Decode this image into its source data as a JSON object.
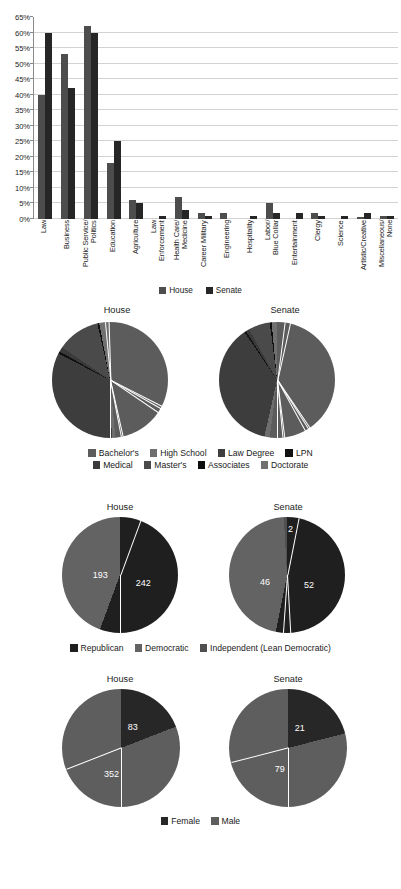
{
  "chart_data": [
    {
      "type": "bar",
      "title": "",
      "xlabel": "",
      "ylabel": "",
      "ylim": [
        0,
        65
      ],
      "grid": true,
      "legend_position": "bottom",
      "ticks": [
        "0%",
        "5%",
        "10%",
        "15%",
        "20%",
        "25%",
        "30%",
        "35%",
        "40%",
        "45%",
        "50%",
        "55%",
        "60%",
        "65%"
      ],
      "categories": [
        "Law",
        "Business",
        "Public Service/\nPolitics",
        "Education",
        "Agriculture",
        "Law\nEnforcement",
        "Health Care/\nMedicine",
        "Career Military",
        "Engineering",
        "Hospitality",
        "Labor/\nBlue Collar",
        "Entertainment",
        "Clergy",
        "Science",
        "Artistic/Creative",
        "Miscellaneous/\nNone"
      ],
      "series": [
        {
          "name": "House",
          "color": "#4d4d4d",
          "values": [
            40,
            53,
            62,
            18,
            6,
            0,
            7,
            2,
            2,
            0,
            5,
            0,
            2,
            0,
            0.5,
            1
          ]
        },
        {
          "name": "Senate",
          "color": "#262626",
          "values": [
            60,
            42,
            60,
            25,
            5,
            1,
            3,
            1,
            0,
            1,
            2,
            2,
            1,
            1,
            2,
            1
          ]
        }
      ]
    },
    {
      "type": "pie",
      "title": "Education",
      "charts": [
        {
          "title": "House",
          "labels": [
            "Bachelor's",
            "High School",
            "Law Degree",
            "LPN",
            "Medical",
            "Master's",
            "Associates",
            "Doctorate"
          ],
          "values": [
            48.5,
            1.0,
            33.0,
            0.7,
            1.3,
            12.0,
            0.5,
            3.0
          ]
        },
        {
          "title": "Senate",
          "labels": [
            "Bachelor's",
            "High School",
            "Law Degree",
            "LPN",
            "Medical",
            "Master's",
            "Associates",
            "Doctorate"
          ],
          "values": [
            52.0,
            1.5,
            37.0,
            0.5,
            1.0,
            6.0,
            0.5,
            1.5
          ]
        }
      ],
      "legend": [
        "Bachelor's",
        "High School",
        "Law Degree",
        "LPN",
        "Medical",
        "Master's",
        "Associates",
        "Doctorate"
      ],
      "legend_position": "bottom"
    },
    {
      "type": "pie",
      "title": "Party",
      "charts": [
        {
          "title": "House",
          "labels": [
            "Republican",
            "Democratic",
            "Independent (Lean Democratic)"
          ],
          "values": [
            242,
            193,
            0
          ],
          "data_labels": [
            "242",
            "193",
            ""
          ]
        },
        {
          "title": "Senate",
          "labels": [
            "Republican",
            "Democratic",
            "Independent (Lean Democratic)"
          ],
          "values": [
            52,
            46,
            2
          ],
          "data_labels": [
            "52",
            "46",
            "2"
          ]
        }
      ],
      "legend": [
        "Republican",
        "Democratic",
        "Independent (Lean Democratic)"
      ],
      "legend_position": "bottom"
    },
    {
      "type": "pie",
      "title": "Gender",
      "charts": [
        {
          "title": "House",
          "labels": [
            "Female",
            "Male"
          ],
          "values": [
            83,
            352
          ],
          "data_labels": [
            "83",
            "352"
          ]
        },
        {
          "title": "Senate",
          "labels": [
            "Female",
            "Male"
          ],
          "values": [
            21,
            79
          ],
          "data_labels": [
            "21",
            "79"
          ]
        }
      ],
      "legend": [
        "Female",
        "Male"
      ],
      "legend_position": "bottom"
    }
  ],
  "bar_chart": {
    "y_ticks": [
      "65%",
      "60%",
      "55%",
      "50%",
      "45%",
      "40%",
      "35%",
      "30%",
      "25%",
      "20%",
      "15%",
      "10%",
      "5%",
      "0%"
    ],
    "categories": [
      {
        "label": "Law"
      },
      {
        "label": "Business"
      },
      {
        "label": "Public Service/\nPolitics"
      },
      {
        "label": "Education"
      },
      {
        "label": "Agriculture"
      },
      {
        "label": "Law\nEnforcement"
      },
      {
        "label": "Health Care/\nMedicine"
      },
      {
        "label": "Career Military"
      },
      {
        "label": "Engineering"
      },
      {
        "label": "Hospitality"
      },
      {
        "label": "Labor/\nBlue Collar"
      },
      {
        "label": "Entertainment"
      },
      {
        "label": "Clergy"
      },
      {
        "label": "Science"
      },
      {
        "label": "Artistic/Creative"
      },
      {
        "label": "Miscellaneous/\nNone"
      }
    ],
    "legend": [
      {
        "label": "House",
        "color": "#4d4d4d"
      },
      {
        "label": "Senate",
        "color": "#262626"
      }
    ]
  },
  "education_section": {
    "house_title": "House",
    "senate_title": "Senate",
    "legend_row1": [
      {
        "label": "Bachelor's",
        "color": "#5c5c5c"
      },
      {
        "label": "High School",
        "color": "#6e6e6e"
      },
      {
        "label": "Law Degree",
        "color": "#3d3d3d"
      },
      {
        "label": "LPN",
        "color": "#111111"
      }
    ],
    "legend_row2": [
      {
        "label": "Medical",
        "color": "#3a3a3a"
      },
      {
        "label": "Master's",
        "color": "#4a4a4a"
      },
      {
        "label": "Associates",
        "color": "#0d0d0d"
      },
      {
        "label": "Doctorate",
        "color": "#707070"
      }
    ]
  },
  "party_section": {
    "house_title": "House",
    "senate_title": "Senate",
    "house_republican": "242",
    "house_democratic": "193",
    "senate_republican": "52",
    "senate_democratic": "46",
    "senate_independent": "2",
    "legend": [
      {
        "label": "Republican",
        "color": "#1f1f1f"
      },
      {
        "label": "Democratic",
        "color": "#636363"
      },
      {
        "label": "Independent (Lean Democratic)",
        "color": "#4f4f4f"
      }
    ]
  },
  "gender_section": {
    "house_title": "House",
    "senate_title": "Senate",
    "house_female": "83",
    "house_male": "352",
    "senate_female": "21",
    "senate_male": "79",
    "legend": [
      {
        "label": "Female",
        "color": "#272727"
      },
      {
        "label": "Male",
        "color": "#5e5e5e"
      }
    ]
  },
  "colors": {
    "house_bar": "#4d4d4d",
    "senate_bar": "#262626",
    "gridline": "#d2d2d2",
    "axis": "#8a8a8a",
    "background": "#ffffff",
    "text": "#1c1c1c"
  }
}
